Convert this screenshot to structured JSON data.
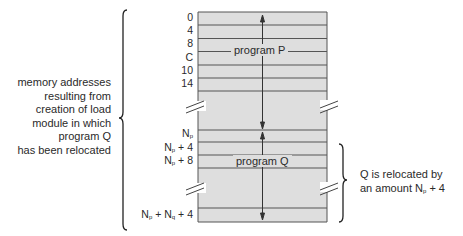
{
  "diagram": {
    "left_annotation": {
      "lines": [
        "memory addresses",
        "resulting from",
        "creation of load",
        "module in which",
        "program Q",
        "has been relocated"
      ]
    },
    "addresses_p": [
      "0",
      "4",
      "8",
      "C",
      "10",
      "14"
    ],
    "addresses_q": [
      {
        "base": "N",
        "sub": "p",
        "suffix": ""
      },
      {
        "base": "N",
        "sub": "p",
        "suffix": " + 4"
      },
      {
        "base": "N",
        "sub": "p",
        "suffix": " + 8"
      },
      {
        "base": "N",
        "sub": "p",
        "suffix": " + N",
        "sub2": "q",
        "suffix2": " + 4"
      }
    ],
    "blocks": {
      "program_p_label": "program P",
      "program_q_label": "program Q"
    },
    "right_annotation": {
      "line1": "Q is relocated by",
      "line2_prefix": "an amount N",
      "line2_sub": "p",
      "line2_suffix": " + 4"
    },
    "colors": {
      "block_fill": "#dedede",
      "line": "#555555",
      "text": "#2a2a2a"
    }
  }
}
